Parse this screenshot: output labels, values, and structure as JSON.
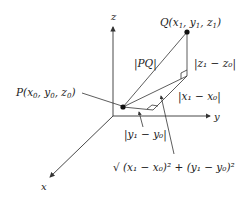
{
  "axes": {
    "x": "x",
    "y": "y",
    "z": "z"
  },
  "points": {
    "P": {
      "name": "P",
      "coords": [
        "x",
        "0",
        "y",
        "0",
        "z",
        "0"
      ]
    },
    "Q": {
      "name": "Q",
      "coords": [
        "x",
        "1",
        "y",
        "1",
        "z",
        "1"
      ]
    }
  },
  "labels": {
    "pq": "|PQ|",
    "dz": "|z₁ − z₀|",
    "dx": "|x₁ − x₀|",
    "dy": "|y₁ − y₀|",
    "diag": "√ (x₁ − x₀)² + (y₁ − y₀)²"
  },
  "colors": {
    "line": "#333333",
    "background": "#ffffff"
  }
}
